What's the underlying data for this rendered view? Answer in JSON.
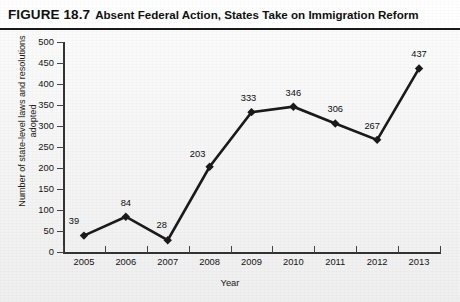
{
  "figure": {
    "number_label": "FIGURE 18.7",
    "caption": "Absent Federal Action, States Take on Immigration Reform"
  },
  "chart_data": {
    "type": "line",
    "title": "Absent Federal Action, States Take on Immigration Reform",
    "xlabel": "Year",
    "ylabel": "Number of state-level laws and resolutions adopted",
    "ylabel_line1": "Number of state-level laws and resolutions",
    "ylabel_line2": "adopted",
    "categories": [
      "2005",
      "2006",
      "2007",
      "2008",
      "2009",
      "2010",
      "2011",
      "2012",
      "2013"
    ],
    "values": [
      39,
      84,
      28,
      203,
      333,
      346,
      306,
      267,
      437
    ],
    "point_labels": [
      "39",
      "84",
      "28",
      "203",
      "333",
      "346",
      "306",
      "267",
      "437"
    ],
    "ylim": [
      0,
      500
    ],
    "ytick_step": 50,
    "ytick_labels": [
      "500",
      "450",
      "400",
      "350",
      "300",
      "250",
      "200",
      "150",
      "100",
      "50",
      "0"
    ],
    "ytick_values": [
      500,
      450,
      400,
      350,
      300,
      250,
      200,
      150,
      100,
      50,
      0
    ],
    "grid": false,
    "legend": false,
    "series_color": "#1a1a1a",
    "marker": "diamond",
    "axis_color": "#333333",
    "background_color": "#f4f4f4"
  }
}
